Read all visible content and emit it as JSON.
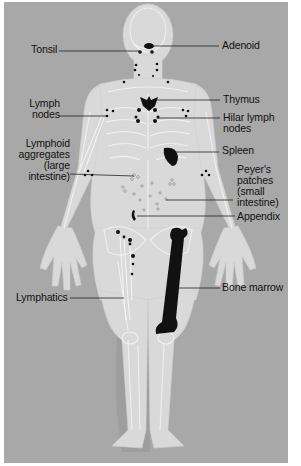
{
  "colors": {
    "background_panel": "#a8a8a8",
    "body_silhouette": "#d9d9d9",
    "skeleton_lines": "#f2f2f2",
    "organ_fill": "#111111",
    "leader_lines": "#222222"
  },
  "labels": {
    "left": [
      {
        "id": "tonsil",
        "text": "Tonsil"
      },
      {
        "id": "lymph_nodes",
        "text": "Lymph\nnodes"
      },
      {
        "id": "lymphoid_aggregates",
        "text": "Lymphoid\naggregates\n(large\nintestine)"
      },
      {
        "id": "lymphatics",
        "text": "Lymphatics"
      }
    ],
    "right": [
      {
        "id": "adenoid",
        "text": "Adenoid"
      },
      {
        "id": "thymus",
        "text": "Thymus"
      },
      {
        "id": "hilar_lymph_nodes",
        "text": "Hilar lymph\nnodes"
      },
      {
        "id": "spleen",
        "text": "Spleen"
      },
      {
        "id": "peyers_patches",
        "text": "Peyer's\npatches\n(small\nintestine)"
      },
      {
        "id": "appendix",
        "text": "Appendix"
      },
      {
        "id": "bone_marrow",
        "text": "Bone marrow"
      }
    ]
  }
}
